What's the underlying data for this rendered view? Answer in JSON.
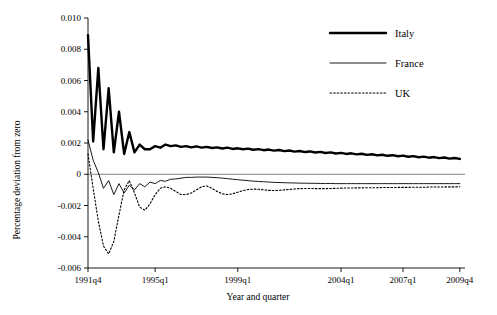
{
  "chart_data": {
    "type": "line",
    "title": "",
    "xlabel": "Year and quarter",
    "ylabel": "Percentage deviation from zero",
    "xlim": [
      0,
      73
    ],
    "ylim": [
      -0.006,
      0.01
    ],
    "grid": false,
    "legend_position": "top-right",
    "x_tick_labels": [
      "1991q4",
      "1995q1",
      "1999q1",
      "2004q1",
      "2007q1",
      "2009q4"
    ],
    "x_tick_positions": [
      0,
      13,
      29,
      49,
      61,
      72
    ],
    "y_tick_labels": [
      "-0.006",
      "-0.004",
      "-0.002",
      "0",
      "0.002",
      "0.004",
      "0.006",
      "0.008",
      "0.010"
    ],
    "y_tick_values": [
      -0.006,
      -0.004,
      -0.002,
      0,
      0.002,
      0.004,
      0.006,
      0.008,
      0.01
    ],
    "series": [
      {
        "name": "Italy",
        "style": "thick-solid",
        "color": "#000000",
        "values": [
          0.0089,
          0.0021,
          0.0068,
          0.0016,
          0.0055,
          0.0014,
          0.004,
          0.0013,
          0.0027,
          0.0014,
          0.0019,
          0.0016,
          0.0016,
          0.0018,
          0.0017,
          0.0019,
          0.0018,
          0.00185,
          0.00175,
          0.0018,
          0.00172,
          0.00178,
          0.0017,
          0.00175,
          0.00168,
          0.00172,
          0.00165,
          0.0017,
          0.00162,
          0.00166,
          0.0016,
          0.00164,
          0.00157,
          0.00161,
          0.00154,
          0.00158,
          0.00151,
          0.00155,
          0.00148,
          0.00152,
          0.00145,
          0.00149,
          0.00142,
          0.00146,
          0.00139,
          0.00143,
          0.00136,
          0.0014,
          0.00133,
          0.00137,
          0.0013,
          0.00134,
          0.00127,
          0.00131,
          0.00124,
          0.00128,
          0.00121,
          0.00125,
          0.00118,
          0.00122,
          0.00115,
          0.00119,
          0.00112,
          0.00116,
          0.00109,
          0.00113,
          0.00106,
          0.0011,
          0.00103,
          0.00107,
          0.001,
          0.00104,
          0.00098
        ]
      },
      {
        "name": "France",
        "style": "thin-solid",
        "color": "#000000",
        "values": [
          0.0022,
          0.0009,
          0.0001,
          -0.0009,
          -0.0004,
          -0.0013,
          -0.0006,
          -0.0012,
          -0.0007,
          -0.001,
          -0.0006,
          -0.0008,
          -0.0005,
          -0.0006,
          -0.0004,
          -0.00045,
          -0.00032,
          -0.0003,
          -0.00025,
          -0.0002,
          -0.0002,
          -0.00018,
          -0.00018,
          -0.00018,
          -0.0002,
          -0.00022,
          -0.00025,
          -0.00028,
          -0.00032,
          -0.00035,
          -0.00038,
          -0.00041,
          -0.00044,
          -0.00046,
          -0.00048,
          -0.0005,
          -0.00052,
          -0.00053,
          -0.00054,
          -0.00055,
          -0.00056,
          -0.00057,
          -0.00057,
          -0.00058,
          -0.00058,
          -0.00059,
          -0.00059,
          -0.00059,
          -0.0006,
          -0.0006,
          -0.0006,
          -0.0006,
          -0.0006,
          -0.0006,
          -0.0006,
          -0.0006,
          -0.0006,
          -0.0006,
          -0.0006,
          -0.0006,
          -0.0006,
          -0.0006,
          -0.0006,
          -0.0006,
          -0.0006,
          -0.0006,
          -0.0006,
          -0.0006,
          -0.0006,
          -0.0006,
          -0.0006,
          -0.0006,
          -0.0006
        ]
      },
      {
        "name": "UK",
        "style": "dotted",
        "color": "#000000",
        "values": [
          0.0013,
          -0.0009,
          -0.003,
          -0.0046,
          -0.0051,
          -0.0043,
          -0.0026,
          -0.001,
          -0.0004,
          -0.0012,
          -0.0021,
          -0.0023,
          -0.0019,
          -0.0013,
          -0.0009,
          -0.0008,
          -0.0009,
          -0.0011,
          -0.0013,
          -0.0013,
          -0.0012,
          -0.001,
          -0.0008,
          -0.00075,
          -0.0009,
          -0.0011,
          -0.00125,
          -0.0013,
          -0.00125,
          -0.00115,
          -0.00105,
          -0.00098,
          -0.00095,
          -0.00096,
          -0.001,
          -0.00103,
          -0.00104,
          -0.00103,
          -0.001,
          -0.00097,
          -0.00094,
          -0.00092,
          -0.00091,
          -0.00091,
          -0.00092,
          -0.00092,
          -0.00092,
          -0.00091,
          -0.0009,
          -0.00089,
          -0.00088,
          -0.00088,
          -0.00087,
          -0.00087,
          -0.00086,
          -0.00086,
          -0.00086,
          -0.00085,
          -0.00085,
          -0.00085,
          -0.00084,
          -0.00084,
          -0.00084,
          -0.00083,
          -0.00083,
          -0.00083,
          -0.00082,
          -0.00082,
          -0.00082,
          -0.00081,
          -0.00081,
          -0.00081,
          -0.0008
        ]
      }
    ]
  }
}
